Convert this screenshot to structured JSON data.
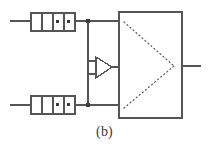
{
  "figure": {
    "caption": "(b)",
    "type": "circuit-schematic",
    "background_color": "#ffffff",
    "line_color": "#555555",
    "dot_color": "#3c3c3c",
    "caption_color": "#3a3a3a"
  },
  "diagram": {
    "registers": [
      {
        "id": "top-register",
        "label": "",
        "x": 31,
        "y": 13,
        "width": 44,
        "height": 18,
        "cells": 4,
        "dots": [
          3,
          4
        ],
        "input_wire": {
          "x1": 10,
          "y1": 21,
          "x2": 31,
          "y2": 21
        },
        "output_wire": {
          "x1": 75,
          "y1": 21,
          "x2": 119,
          "y2": 21
        }
      },
      {
        "id": "bottom-register",
        "label": "",
        "x": 31,
        "y": 96,
        "width": 44,
        "height": 18,
        "cells": 4,
        "dots": [
          3,
          4
        ],
        "input_wire": {
          "x1": 10,
          "y1": 105,
          "x2": 31,
          "y2": 105
        },
        "output_wire": {
          "x1": 75,
          "y1": 105,
          "x2": 119,
          "y2": 105
        }
      }
    ],
    "junctions": [
      {
        "id": "top-junction",
        "cx": 88,
        "cy": 21,
        "r": 2
      },
      {
        "id": "bottom-junction",
        "cx": 88,
        "cy": 105,
        "r": 2
      }
    ],
    "bus": {
      "x": 88,
      "y1": 21,
      "y2": 105
    },
    "amplifier": {
      "id": "differential-amplifier",
      "apex_x": 112,
      "apex_y": 67,
      "back_x": 96,
      "top_y": 57,
      "bottom_y": 78,
      "inputs": [
        {
          "x1": 88,
          "y1": 61,
          "x2": 96,
          "y2": 61
        },
        {
          "x1": 88,
          "y1": 74,
          "x2": 96,
          "y2": 74
        }
      ],
      "output_wire": {
        "x1": 112,
        "y1": 67,
        "x2": 119,
        "y2": 67
      }
    },
    "main_block": {
      "id": "processing-block",
      "x": 119,
      "y": 12,
      "width": 63,
      "height": 106,
      "dotted_triangle": {
        "p1": {
          "x": 124,
          "y": 22
        },
        "p2": {
          "x": 124,
          "y": 108
        },
        "apex": {
          "x": 174,
          "y": 66
        }
      },
      "output_wire": {
        "x1": 182,
        "y1": 66,
        "x2": 201,
        "y2": 66
      }
    }
  }
}
